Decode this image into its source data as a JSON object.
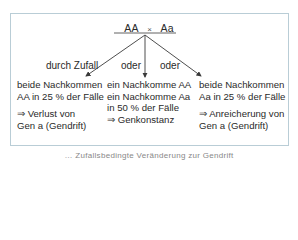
{
  "cross": {
    "parent1": "AA",
    "operator": "×",
    "parent2": "Aa"
  },
  "branches": [
    {
      "label": "durch Zufall"
    },
    {
      "label": "oder"
    },
    {
      "label": "oder"
    }
  ],
  "outcomes": [
    {
      "line1": "beide Nachkommen",
      "line2": "AA in 25 % der Fälle",
      "line3": "",
      "result1": "⇒ Verlust von",
      "result2": "Gen a (Gendrift)"
    },
    {
      "line1": "ein Nachkomme AA",
      "line2": "ein Nachkomme Aa",
      "line3": "in 50 % der Fälle",
      "result1": "⇒ Genkonstanz",
      "result2": ""
    },
    {
      "line1": "beide Nachkommen",
      "line2": "Aa in 25 % der Fälle",
      "line3": "",
      "result1": "⇒ Anreicherung von",
      "result2": "Gen a (Gendrift)"
    }
  ],
  "caption": "… Zufallsbedingte Veränderung zur Gendrift",
  "colors": {
    "border": "#b9cdd6",
    "arrow": "#3a3a3a"
  }
}
